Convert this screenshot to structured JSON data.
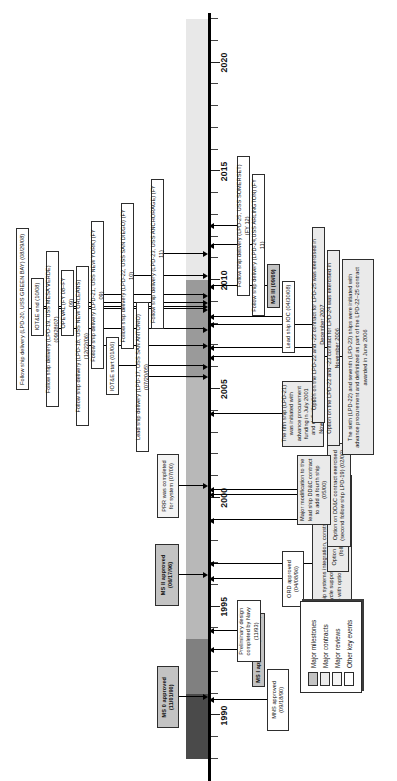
{
  "figure": {
    "type": "timeline",
    "orientation": "rotated-90"
  },
  "axis": {
    "start_year": 1988,
    "end_year": 2022,
    "tick_interval": 1,
    "label_interval": 5,
    "labels": [
      "1990",
      "1995",
      "2000",
      "2005",
      "2010",
      "2015",
      "2020"
    ],
    "label_years": [
      1990,
      1995,
      2000,
      2005,
      2010,
      2015,
      2020
    ]
  },
  "phases": [
    {
      "name": "phase-dark",
      "from": 1988,
      "to": 1991,
      "color": "#4a4a4a"
    },
    {
      "name": "phase-mid",
      "from": 1991,
      "to": 1993.5,
      "color": "#808080"
    },
    {
      "name": "phase-light",
      "from": 1993.5,
      "to": 2005.5,
      "color": "#b8b8b8"
    },
    {
      "name": "phase-mid2",
      "from": 2005.5,
      "to": 2010,
      "color": "#9a9a9a"
    },
    {
      "name": "phase-pale",
      "from": 2010,
      "to": 2022,
      "color": "#e8e8e8"
    }
  ],
  "legend": {
    "items": [
      {
        "label": "Major milestones",
        "color": "#c3c3c3",
        "category": "milestone"
      },
      {
        "label": "Major contracts",
        "color": "#eaeaea",
        "category": "contract"
      },
      {
        "label": "Major reviews",
        "color": "#f4f4f4",
        "category": "review"
      },
      {
        "label": "Other key events",
        "color": "#ffffff",
        "category": "other"
      }
    ]
  },
  "events": [
    {
      "id": "mns-approved",
      "text": "MNS approved (09/18/90)",
      "category": "other",
      "year": 1990.72,
      "side": "below"
    },
    {
      "id": "ms-0-approved",
      "text": "MS 0 approved (11/01/90)",
      "category": "milestone",
      "year": 1990.84,
      "side": "above"
    },
    {
      "id": "ms-1-approved",
      "text": "MS I approved (01/11/93)",
      "category": "milestone",
      "year": 1993.03,
      "side": "below"
    },
    {
      "id": "prelim-design",
      "text": "Preliminary design completed by Navy (11/93)",
      "category": "other",
      "year": 1993.87,
      "side": "below"
    },
    {
      "id": "ord-approved",
      "text": "ORD approved (04/08/96)",
      "category": "other",
      "year": 1996.27,
      "side": "below"
    },
    {
      "id": "ms-2-approved",
      "text": "MS II approved (06/17/96)",
      "category": "milestone",
      "year": 1996.46,
      "side": "above"
    },
    {
      "id": "ddc-contract-awarded",
      "text": "Detail design, ship systems integration, construction, testing, logistics, and life-cycle support contract was awarded to Avondale Industries (lead ship with options for up to 2 follow ships) (12/17/96)",
      "category": "contract",
      "year": 1996.96,
      "side": "below"
    },
    {
      "id": "ddc-option-lpd18",
      "text": "Option on DD&C contract exercised (follow ship LPD-18) (12/98)",
      "category": "contract",
      "year": 1998.96,
      "side": "below"
    },
    {
      "id": "ddc-option-lpd19",
      "text": "Option on DD&C contract exercised (second follow ship LPD-19) (02/00)",
      "category": "contract",
      "year": 2000.12,
      "side": "below"
    },
    {
      "id": "major-modification",
      "text": "Major modification to the lead ship DD&C contract to add a fourth ship (05/00)",
      "category": "contract",
      "year": 2000.37,
      "side": "below"
    },
    {
      "id": "prr-completed",
      "text": "PRR was completed for system (07/00)",
      "category": "review",
      "year": 2000.54,
      "side": "above"
    },
    {
      "id": "fifth-ship-lpd21",
      "text": "The fifth ship (LPD-21) was initiated with advance procurement funding in July 2001 and definitized in November 2003",
      "category": "contract",
      "year": 2003.87,
      "side": "below"
    },
    {
      "id": "lead-ship-delivery-lpd17",
      "text": "Lead ship delivery (LPD-17, USS SAN ANTONIO) (07/20/05)",
      "category": "other",
      "year": 2005.55,
      "side": "above"
    },
    {
      "id": "iote-start",
      "text": "IOT&E start (01/06)",
      "category": "other",
      "year": 2006.04,
      "side": "above"
    },
    {
      "id": "follow-lpd18",
      "text": "Follow ship delivery (LPD-18, USS NEW ORLEANS) (12/22/06)",
      "category": "other",
      "year": 2006.97,
      "side": "above"
    },
    {
      "id": "sixth-seventh-ships",
      "text": "The sixth (LPD-22) and seventh (LPD-23) ships were initiated with advance procurement and definitized as part of the LPD-22–25 contract awarded in June 2006",
      "category": "contract",
      "year": 2006.45,
      "side": "below"
    },
    {
      "id": "option-lpd24",
      "text": "Option on the LPD-22 and -23 contract for LPD-24 was exercised in November 2006",
      "category": "contract",
      "year": 2006.87,
      "side": "below"
    },
    {
      "id": "follow-lpd19",
      "text": "Follow ship delivery (LPD-19, USS MESA VERDE) (09/28/07)",
      "category": "other",
      "year": 2007.74,
      "side": "above"
    },
    {
      "id": "option-lpd25",
      "text": "Option on the LPD-22 and -23 contract for LPD-25 was exercised in December 2007",
      "category": "contract",
      "year": 2007.96,
      "side": "below"
    },
    {
      "id": "lead-ship-ioc",
      "text": "Lead ship IOC (04/30/08)",
      "category": "other",
      "year": 2008.33,
      "side": "below"
    },
    {
      "id": "follow-lpd20",
      "text": "Follow ship delivery (LPD-20, USS GREEN BAY) (08/29/08)",
      "category": "other",
      "year": 2008.66,
      "side": "above"
    },
    {
      "id": "iote-end",
      "text": "IOT&E end (10/08)",
      "category": "other",
      "year": 2008.79,
      "side": "above"
    },
    {
      "id": "opeval",
      "text": "OPEVAL (FY 08–FY 09)",
      "category": "other",
      "year": 2008.95,
      "side": "above"
    },
    {
      "id": "ms-3",
      "text": "MS III (09/09)",
      "category": "milestone",
      "year": 2009.71,
      "side": "below"
    },
    {
      "id": "follow-lpd21",
      "text": "Follow ship delivery (LPD-21, USS NEW YORK) (FY 09)",
      "category": "other",
      "year": 2009.3,
      "side": "above"
    },
    {
      "id": "follow-lpd22",
      "text": "Follow ship delivery (LPD-22, USS SAN DIEGO) (FY 10)",
      "category": "other",
      "year": 2010.2,
      "side": "above"
    },
    {
      "id": "follow-lpd23",
      "text": "Follow ship delivery (LPD-23, USS ANCHORAGE) (FY 11)",
      "category": "other",
      "year": 2011.2,
      "side": "above"
    },
    {
      "id": "follow-lpd24",
      "text": "Follow ship delivery (LPD-24,USS ARLINGTON) (FY 11)",
      "category": "other",
      "year": 2011.6,
      "side": "below"
    },
    {
      "id": "follow-lpd25",
      "text": "Follow ship delivery (LPD-25, USS SOMERSET) (FY 12)",
      "category": "other",
      "year": 2012.5,
      "side": "below"
    }
  ]
}
